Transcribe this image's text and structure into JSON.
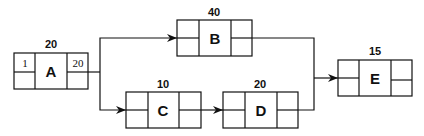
{
  "diagram": {
    "type": "activity-on-node network",
    "nodes": [
      {
        "id": "A",
        "label": "A",
        "duration": "20",
        "top_left": "1",
        "top_right": "20",
        "bottom_left": "",
        "bottom_right": ""
      },
      {
        "id": "B",
        "label": "B",
        "duration": "40",
        "top_left": "",
        "top_right": "",
        "bottom_left": "",
        "bottom_right": ""
      },
      {
        "id": "C",
        "label": "C",
        "duration": "10",
        "top_left": "",
        "top_right": "",
        "bottom_left": "",
        "bottom_right": ""
      },
      {
        "id": "D",
        "label": "D",
        "duration": "20",
        "top_left": "",
        "top_right": "",
        "bottom_left": "",
        "bottom_right": ""
      },
      {
        "id": "E",
        "label": "E",
        "duration": "15",
        "top_left": "",
        "top_right": "",
        "bottom_left": "",
        "bottom_right": ""
      }
    ],
    "edges": [
      {
        "from": "A",
        "to": "B"
      },
      {
        "from": "A",
        "to": "C"
      },
      {
        "from": "C",
        "to": "D"
      },
      {
        "from": "B",
        "to": "E"
      },
      {
        "from": "D",
        "to": "E"
      }
    ]
  }
}
